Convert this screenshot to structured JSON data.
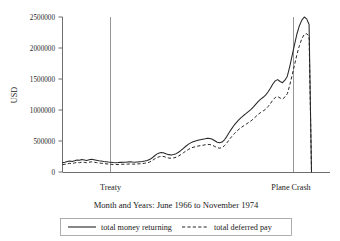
{
  "chart_data": {
    "type": "line",
    "title": "",
    "subtitle": "",
    "xlabel": "Month and Years: June 1966 to November 1974",
    "ylabel": "USD",
    "ylim": [
      0,
      2650000
    ],
    "yticks": [
      0,
      500000,
      1000000,
      1500000,
      2000000,
      2500000
    ],
    "ytick_labels": [
      "0",
      "500000",
      "1000000",
      "1500000",
      "2000000",
      "2500000"
    ],
    "grid": false,
    "legend_position": "bottom-outside",
    "x_axis_note": "monthly observations, June 1966 through November 1974",
    "annotations": [
      {
        "label": "Treaty",
        "x_index": 22,
        "type": "vertical-line"
      },
      {
        "label": "Plane Crash",
        "x_index": 93,
        "type": "vertical-line"
      }
    ],
    "series": [
      {
        "name": "total money returning",
        "style": "solid",
        "values": [
          150000,
          158000,
          168000,
          176000,
          170000,
          182000,
          195000,
          188000,
          200000,
          193000,
          186000,
          196000,
          205000,
          198000,
          190000,
          182000,
          176000,
          170000,
          165000,
          160000,
          156000,
          152000,
          150000,
          152000,
          155000,
          158000,
          156000,
          160000,
          163000,
          160000,
          158000,
          162000,
          166000,
          170000,
          176000,
          185000,
          200000,
          225000,
          258000,
          288000,
          305000,
          316000,
          308000,
          292000,
          280000,
          275000,
          282000,
          296000,
          318000,
          348000,
          382000,
          415000,
          445000,
          470000,
          488000,
          500000,
          512000,
          520000,
          528000,
          536000,
          545000,
          542000,
          528000,
          505000,
          480000,
          470000,
          482000,
          520000,
          575000,
          640000,
          700000,
          755000,
          800000,
          845000,
          880000,
          915000,
          945000,
          978000,
          1010000,
          1050000,
          1095000,
          1140000,
          1175000,
          1205000,
          1240000,
          1290000,
          1350000,
          1420000,
          1470000,
          1490000,
          1460000,
          1440000,
          1480000,
          1545000,
          1700000,
          1880000,
          2060000,
          2230000,
          2360000,
          2450000,
          2500000,
          2470000,
          2380000,
          0
        ]
      },
      {
        "name": "total deferred pay",
        "style": "dashed",
        "values": [
          118000,
          124000,
          132000,
          140000,
          136000,
          146000,
          156000,
          150000,
          160000,
          155000,
          149000,
          158000,
          164000,
          158000,
          152000,
          146000,
          141000,
          136000,
          132000,
          128000,
          125000,
          122000,
          120000,
          122000,
          124000,
          126000,
          125000,
          128000,
          130000,
          128000,
          126000,
          130000,
          133000,
          136000,
          141000,
          148000,
          160000,
          180000,
          208000,
          232000,
          246000,
          255000,
          248000,
          235000,
          225000,
          221000,
          227000,
          239000,
          257000,
          282000,
          310000,
          337000,
          362000,
          383000,
          398000,
          408000,
          418000,
          425000,
          431000,
          438000,
          445000,
          442000,
          431000,
          412000,
          392000,
          384000,
          394000,
          425000,
          470000,
          523000,
          572000,
          617000,
          654000,
          690000,
          719000,
          747000,
          772000,
          799000,
          825000,
          858000,
          895000,
          931000,
          960000,
          984000,
          1013000,
          1054000,
          1103000,
          1160000,
          1201000,
          1217000,
          1193000,
          1176000,
          1209000,
          1262000,
          1400000,
          1560000,
          1730000,
          1900000,
          2040000,
          2150000,
          2220000,
          2230000,
          2190000,
          0
        ]
      }
    ]
  },
  "axis": {
    "y_label": "USD",
    "y_ticks": [
      "2500000",
      "2000000",
      "1500000",
      "1000000",
      "500000",
      "0"
    ],
    "x_caption": "Month and Years: June 1966 to November 1974"
  },
  "events": {
    "treaty": "Treaty",
    "plane_crash": "Plane Crash"
  },
  "legend": {
    "entries": [
      {
        "label": "total money returning",
        "style": "solid"
      },
      {
        "label": "total deferred pay",
        "style": "dashed"
      }
    ]
  },
  "colors": {
    "series": "#262626",
    "axis": "#6e6e6e",
    "event_line": "#8a8a8a",
    "legend_border": "#9a9a9a",
    "background": "#ffffff"
  }
}
